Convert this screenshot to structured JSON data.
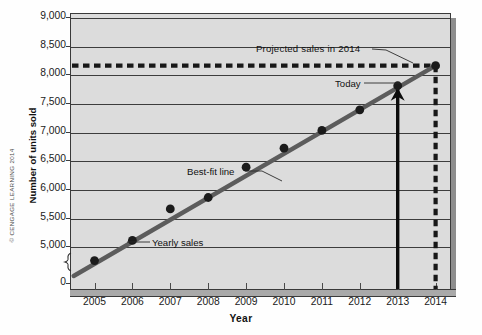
{
  "credit": "© CENGAGE LEARNING 2014",
  "annotations": {
    "projected": "Projected sales in 2014",
    "today": "Today",
    "best_fit": "Best-fit line",
    "yearly_sales": "Yearly sales"
  },
  "chart_data": {
    "type": "scatter",
    "title": "",
    "xlabel": "Year",
    "ylabel": "Number of units sold",
    "grid": true,
    "legend_position": "inline-annotations",
    "x_tick_labels": [
      "2005",
      "2006",
      "2007",
      "2008",
      "2009",
      "2010",
      "2011",
      "2012",
      "2013",
      "2014"
    ],
    "y_tick_labels": [
      "0",
      "5,000",
      "5,500",
      "6,000",
      "6,500",
      "7,000",
      "7,500",
      "8,000",
      "8,500",
      "9,000"
    ],
    "y_tick_values": [
      0,
      5000,
      5500,
      6000,
      6500,
      7000,
      7500,
      8000,
      8500,
      9000
    ],
    "y_axis_break": true,
    "y_axis_break_between": [
      0,
      5000
    ],
    "ylim": [
      4750,
      9000
    ],
    "xlim": [
      2004.4,
      2014.6
    ],
    "series": [
      {
        "name": "Yearly sales",
        "type": "scatter",
        "x": [
          2005,
          2006,
          2007,
          2008,
          2009,
          2010,
          2011,
          2012,
          2013
        ],
        "values": [
          4750,
          5100,
          5650,
          5850,
          6380,
          6710,
          7020,
          7380,
          7800
        ]
      },
      {
        "name": "Best-fit line",
        "type": "line",
        "x": [
          2004.45,
          2014.0
        ],
        "values": [
          4480,
          8150
        ]
      }
    ],
    "projection": {
      "label": "Projected sales in 2014",
      "year": 2014,
      "value": 8150,
      "horizontal_guide_value": 8150,
      "vertical_guide_year": 2014,
      "style": "dashed"
    },
    "today_marker": {
      "label": "Today",
      "year": 2013,
      "value": 7800,
      "style": "solid-arrow"
    }
  }
}
